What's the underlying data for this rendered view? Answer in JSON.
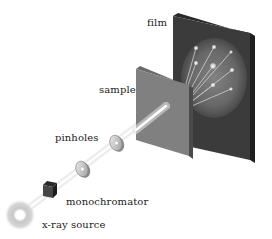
{
  "diagram": {
    "components": [
      {
        "id": "xray-source",
        "label": "x-ray source"
      },
      {
        "id": "monochromator",
        "label": "monochromator"
      },
      {
        "id": "pinholes",
        "label": "pinholes"
      },
      {
        "id": "sample",
        "label": "sample"
      },
      {
        "id": "film",
        "label": "film"
      }
    ],
    "flow": [
      "x-ray source",
      "monochromator",
      "pinholes",
      "sample",
      "film"
    ],
    "colors": {
      "film_face": "#3a3a3a",
      "film_edge": "#2a2a2a",
      "sample_face": "#7d7d7d",
      "sample_edge": "#555555",
      "beam": "#f2f2f2",
      "monochromator": "#3c3c3c",
      "source_glow": "#bdbdbd"
    }
  }
}
